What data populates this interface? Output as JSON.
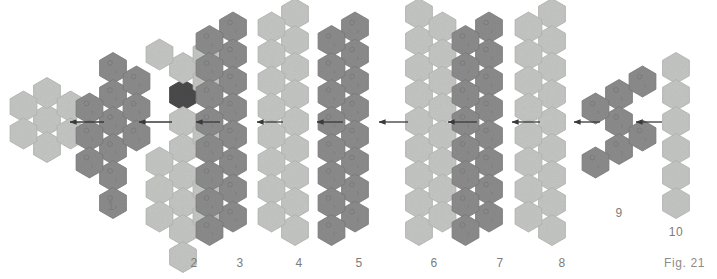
{
  "figure": {
    "caption": "Fig. 21",
    "background_color": "#ffffff",
    "label_color": "#7c7c7c",
    "arrow_color": "#3a3a3a",
    "palette": {
      "light": "#c3c5c2",
      "light_edge": "#b0b2af",
      "dark": "#8b8b8b",
      "dark_edge": "#787878",
      "accent": "#4a4a4a",
      "accent_edge": "#3d3d3d"
    },
    "hex_geometry": {
      "radius": 15.5,
      "col_step": 23.5,
      "row_step": 27.0,
      "orientation": "pointy-top"
    },
    "clusters": [
      {
        "id": "seed",
        "label": "",
        "shade": "light",
        "label_x": 0,
        "label_y": 0,
        "origin_x": 47,
        "origin_y": 120,
        "cells": [
          {
            "col": 0,
            "row": 0,
            "shade": "light"
          },
          {
            "col": 0,
            "row": -1,
            "shade": "light"
          },
          {
            "col": 0,
            "row": 1,
            "shade": "light"
          },
          {
            "col": -1,
            "row": -0.5,
            "shade": "light"
          },
          {
            "col": -1,
            "row": 0.5,
            "shade": "light"
          },
          {
            "col": 1,
            "row": -0.5,
            "shade": "light"
          },
          {
            "col": 1,
            "row": 0.5,
            "shade": "light"
          }
        ]
      },
      {
        "id": "c1",
        "label": "1",
        "shade": "dark",
        "label_x": 111,
        "label_y": 199,
        "origin_x": 113,
        "origin_y": 122,
        "cells": [
          {
            "col": 0,
            "row": -2,
            "shade": "dark"
          },
          {
            "col": 0,
            "row": -1,
            "shade": "dark"
          },
          {
            "col": 0,
            "row": 0,
            "shade": "dark"
          },
          {
            "col": 0,
            "row": 1,
            "shade": "dark"
          },
          {
            "col": 0,
            "row": 2,
            "shade": "dark"
          },
          {
            "col": 1,
            "row": -1.5,
            "shade": "dark"
          },
          {
            "col": 1,
            "row": -0.5,
            "shade": "dark"
          },
          {
            "col": 1,
            "row": 0.5,
            "shade": "dark"
          },
          {
            "col": -1,
            "row": -0.5,
            "shade": "dark"
          },
          {
            "col": -1,
            "row": 0.5,
            "shade": "dark"
          },
          {
            "col": -1,
            "row": 1.5,
            "shade": "dark"
          },
          {
            "col": 0,
            "row": 3,
            "shade": "dark"
          }
        ]
      },
      {
        "id": "c2",
        "label": "2",
        "shade": "light",
        "label_x": 194,
        "label_y": 256,
        "origin_x": 183,
        "origin_y": 122,
        "cells": [
          {
            "col": 0,
            "row": -1,
            "shade": "accent"
          },
          {
            "col": 0,
            "row": -2,
            "shade": "light"
          },
          {
            "col": -1,
            "row": -2.5,
            "shade": "light"
          },
          {
            "col": 1,
            "row": -2.5,
            "shade": "light"
          },
          {
            "col": 1,
            "row": -1.5,
            "shade": "light"
          },
          {
            "col": 0,
            "row": 0,
            "shade": "light"
          },
          {
            "col": 0,
            "row": 1,
            "shade": "light"
          },
          {
            "col": 0,
            "row": 2,
            "shade": "light"
          },
          {
            "col": 0,
            "row": 3,
            "shade": "light"
          },
          {
            "col": 0,
            "row": 4,
            "shade": "light"
          },
          {
            "col": -1,
            "row": 1.5,
            "shade": "light"
          },
          {
            "col": -1,
            "row": 2.5,
            "shade": "light"
          },
          {
            "col": -1,
            "row": 3.5,
            "shade": "light"
          },
          {
            "col": 1,
            "row": 0.5,
            "shade": "light"
          },
          {
            "col": 1,
            "row": 2.5,
            "shade": "light"
          },
          {
            "col": 1,
            "row": 3.5,
            "shade": "light"
          },
          {
            "col": 0,
            "row": 5,
            "shade": "light"
          }
        ]
      },
      {
        "id": "c3",
        "label": "3",
        "shade": "dark",
        "label_x": 240,
        "label_y": 256,
        "origin_x": 233,
        "origin_y": 122,
        "cells": [
          {
            "col": 0,
            "row": -3.5,
            "shade": "dark"
          },
          {
            "col": 0,
            "row": -2.5,
            "shade": "dark"
          },
          {
            "col": 0,
            "row": -1.5,
            "shade": "dark"
          },
          {
            "col": 0,
            "row": -0.5,
            "shade": "dark"
          },
          {
            "col": 0,
            "row": 0.5,
            "shade": "dark"
          },
          {
            "col": 0,
            "row": 1.5,
            "shade": "dark"
          },
          {
            "col": 0,
            "row": 2.5,
            "shade": "dark"
          },
          {
            "col": 0,
            "row": 3.5,
            "shade": "dark"
          },
          {
            "col": -1,
            "row": -3,
            "shade": "dark"
          },
          {
            "col": -1,
            "row": -2,
            "shade": "dark"
          },
          {
            "col": -1,
            "row": -1,
            "shade": "dark"
          },
          {
            "col": -1,
            "row": 0,
            "shade": "dark"
          },
          {
            "col": -1,
            "row": 1,
            "shade": "dark"
          },
          {
            "col": -1,
            "row": 2,
            "shade": "dark"
          },
          {
            "col": -1,
            "row": 3,
            "shade": "dark"
          },
          {
            "col": -1,
            "row": 4,
            "shade": "dark"
          }
        ]
      },
      {
        "id": "c4",
        "label": "4",
        "shade": "light",
        "label_x": 299,
        "label_y": 256,
        "origin_x": 295,
        "origin_y": 122,
        "cells": [
          {
            "col": 0,
            "row": -4,
            "shade": "light"
          },
          {
            "col": 0,
            "row": -3,
            "shade": "light"
          },
          {
            "col": 0,
            "row": -2,
            "shade": "light"
          },
          {
            "col": 0,
            "row": -1,
            "shade": "light"
          },
          {
            "col": 0,
            "row": 0,
            "shade": "light"
          },
          {
            "col": 0,
            "row": 1,
            "shade": "light"
          },
          {
            "col": 0,
            "row": 2,
            "shade": "light"
          },
          {
            "col": 0,
            "row": 3,
            "shade": "light"
          },
          {
            "col": 0,
            "row": 4,
            "shade": "light"
          },
          {
            "col": -1,
            "row": -3.5,
            "shade": "light"
          },
          {
            "col": -1,
            "row": -2.5,
            "shade": "light"
          },
          {
            "col": -1,
            "row": -1.5,
            "shade": "light"
          },
          {
            "col": -1,
            "row": -0.5,
            "shade": "light"
          },
          {
            "col": -1,
            "row": 0.5,
            "shade": "light"
          },
          {
            "col": -1,
            "row": 1.5,
            "shade": "light"
          },
          {
            "col": -1,
            "row": 2.5,
            "shade": "light"
          },
          {
            "col": -1,
            "row": 3.5,
            "shade": "light"
          }
        ]
      },
      {
        "id": "c5",
        "label": "5",
        "shade": "dark",
        "label_x": 359,
        "label_y": 256,
        "origin_x": 355,
        "origin_y": 122,
        "cells": [
          {
            "col": 0,
            "row": -3.5,
            "shade": "dark"
          },
          {
            "col": 0,
            "row": -2.5,
            "shade": "dark"
          },
          {
            "col": 0,
            "row": -1.5,
            "shade": "dark"
          },
          {
            "col": 0,
            "row": -0.5,
            "shade": "dark"
          },
          {
            "col": 0,
            "row": 0.5,
            "shade": "dark"
          },
          {
            "col": 0,
            "row": 1.5,
            "shade": "dark"
          },
          {
            "col": 0,
            "row": 2.5,
            "shade": "dark"
          },
          {
            "col": 0,
            "row": 3.5,
            "shade": "dark"
          },
          {
            "col": -1,
            "row": -3,
            "shade": "dark"
          },
          {
            "col": -1,
            "row": -2,
            "shade": "dark"
          },
          {
            "col": -1,
            "row": -1,
            "shade": "dark"
          },
          {
            "col": -1,
            "row": 0,
            "shade": "dark"
          },
          {
            "col": -1,
            "row": 1,
            "shade": "dark"
          },
          {
            "col": -1,
            "row": 2,
            "shade": "dark"
          },
          {
            "col": -1,
            "row": 3,
            "shade": "dark"
          },
          {
            "col": -1,
            "row": 4,
            "shade": "dark"
          }
        ]
      },
      {
        "id": "c6",
        "label": "6",
        "shade": "light",
        "label_x": 434,
        "label_y": 256,
        "origin_x": 419,
        "origin_y": 122,
        "cells": [
          {
            "col": 0,
            "row": -4,
            "shade": "light"
          },
          {
            "col": 0,
            "row": -3,
            "shade": "light"
          },
          {
            "col": 0,
            "row": -2,
            "shade": "light"
          },
          {
            "col": 0,
            "row": -1,
            "shade": "light"
          },
          {
            "col": 0,
            "row": 0,
            "shade": "light"
          },
          {
            "col": 0,
            "row": 1,
            "shade": "light"
          },
          {
            "col": 0,
            "row": 2,
            "shade": "light"
          },
          {
            "col": 0,
            "row": 3,
            "shade": "light"
          },
          {
            "col": 0,
            "row": 4,
            "shade": "light"
          },
          {
            "col": 1,
            "row": -3.5,
            "shade": "light"
          },
          {
            "col": 1,
            "row": -2.5,
            "shade": "light"
          },
          {
            "col": 1,
            "row": -1.5,
            "shade": "light"
          },
          {
            "col": 1,
            "row": -0.5,
            "shade": "light"
          },
          {
            "col": 1,
            "row": 0.5,
            "shade": "light"
          },
          {
            "col": 1,
            "row": 1.5,
            "shade": "light"
          },
          {
            "col": 1,
            "row": 2.5,
            "shade": "light"
          },
          {
            "col": 1,
            "row": 3.5,
            "shade": "light"
          }
        ]
      },
      {
        "id": "c7",
        "label": "7",
        "shade": "dark",
        "label_x": 500,
        "label_y": 256,
        "origin_x": 489,
        "origin_y": 122,
        "cells": [
          {
            "col": 0,
            "row": -3.5,
            "shade": "dark"
          },
          {
            "col": 0,
            "row": -2.5,
            "shade": "dark"
          },
          {
            "col": 0,
            "row": -1.5,
            "shade": "dark"
          },
          {
            "col": 0,
            "row": -0.5,
            "shade": "dark"
          },
          {
            "col": 0,
            "row": 0.5,
            "shade": "dark"
          },
          {
            "col": 0,
            "row": 1.5,
            "shade": "dark"
          },
          {
            "col": 0,
            "row": 2.5,
            "shade": "dark"
          },
          {
            "col": 0,
            "row": 3.5,
            "shade": "dark"
          },
          {
            "col": -1,
            "row": -3,
            "shade": "dark"
          },
          {
            "col": -1,
            "row": -2,
            "shade": "dark"
          },
          {
            "col": -1,
            "row": -1,
            "shade": "dark"
          },
          {
            "col": -1,
            "row": 0,
            "shade": "dark"
          },
          {
            "col": -1,
            "row": 1,
            "shade": "dark"
          },
          {
            "col": -1,
            "row": 2,
            "shade": "dark"
          },
          {
            "col": -1,
            "row": 3,
            "shade": "dark"
          },
          {
            "col": -1,
            "row": 4,
            "shade": "dark"
          }
        ]
      },
      {
        "id": "c8",
        "label": "8",
        "shade": "light",
        "label_x": 562,
        "label_y": 256,
        "origin_x": 552,
        "origin_y": 122,
        "cells": [
          {
            "col": 0,
            "row": -4,
            "shade": "light"
          },
          {
            "col": 0,
            "row": -3,
            "shade": "light"
          },
          {
            "col": 0,
            "row": -2,
            "shade": "light"
          },
          {
            "col": 0,
            "row": -1,
            "shade": "light"
          },
          {
            "col": 0,
            "row": 0,
            "shade": "light"
          },
          {
            "col": 0,
            "row": 1,
            "shade": "light"
          },
          {
            "col": 0,
            "row": 2,
            "shade": "light"
          },
          {
            "col": 0,
            "row": 3,
            "shade": "light"
          },
          {
            "col": 0,
            "row": 4,
            "shade": "light"
          },
          {
            "col": -1,
            "row": -3.5,
            "shade": "light"
          },
          {
            "col": -1,
            "row": -2.5,
            "shade": "light"
          },
          {
            "col": -1,
            "row": -1.5,
            "shade": "light"
          },
          {
            "col": -1,
            "row": -0.5,
            "shade": "light"
          },
          {
            "col": -1,
            "row": 0.5,
            "shade": "light"
          },
          {
            "col": -1,
            "row": 1.5,
            "shade": "light"
          },
          {
            "col": -1,
            "row": 2.5,
            "shade": "light"
          },
          {
            "col": -1,
            "row": 3.5,
            "shade": "light"
          }
        ]
      },
      {
        "id": "c9",
        "label": "9",
        "shade": "dark",
        "label_x": 619,
        "label_y": 206,
        "origin_x": 619,
        "origin_y": 122,
        "cells": [
          {
            "col": 0,
            "row": -1,
            "shade": "dark"
          },
          {
            "col": 0,
            "row": 0,
            "shade": "dark"
          },
          {
            "col": 0,
            "row": 1,
            "shade": "dark"
          },
          {
            "col": -1,
            "row": -0.5,
            "shade": "dark"
          },
          {
            "col": -1,
            "row": 1.5,
            "shade": "dark"
          },
          {
            "col": 1,
            "row": -1.5,
            "shade": "dark"
          },
          {
            "col": 1,
            "row": 0.5,
            "shade": "dark"
          }
        ]
      },
      {
        "id": "c10",
        "label": "10",
        "shade": "light",
        "label_x": 676,
        "label_y": 225,
        "origin_x": 676,
        "origin_y": 122,
        "cells": [
          {
            "col": 0,
            "row": -2,
            "shade": "light"
          },
          {
            "col": 0,
            "row": -1,
            "shade": "light"
          },
          {
            "col": 0,
            "row": 0,
            "shade": "light"
          },
          {
            "col": 0,
            "row": 1,
            "shade": "light"
          },
          {
            "col": 0,
            "row": 2,
            "shade": "light"
          },
          {
            "col": 0,
            "row": 3,
            "shade": "light"
          }
        ]
      }
    ],
    "arrows": [
      {
        "id": "a1",
        "from_x": 104,
        "to_x": 70,
        "y": 122
      },
      {
        "id": "a2",
        "from_x": 172,
        "to_x": 139,
        "y": 122
      },
      {
        "id": "a3",
        "from_x": 220,
        "to_x": 196,
        "y": 122
      },
      {
        "id": "a4",
        "from_x": 283,
        "to_x": 257,
        "y": 122
      },
      {
        "id": "a5",
        "from_x": 343,
        "to_x": 317,
        "y": 122
      },
      {
        "id": "a6",
        "from_x": 408,
        "to_x": 379,
        "y": 122
      },
      {
        "id": "a7",
        "from_x": 477,
        "to_x": 448,
        "y": 122
      },
      {
        "id": "a8",
        "from_x": 540,
        "to_x": 512,
        "y": 122
      },
      {
        "id": "a9",
        "from_x": 600,
        "to_x": 574,
        "y": 122
      },
      {
        "id": "a10",
        "from_x": 662,
        "to_x": 636,
        "y": 122
      }
    ]
  }
}
